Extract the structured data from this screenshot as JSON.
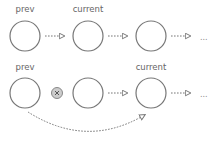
{
  "diagram": {
    "colors": {
      "stroke": "#777777",
      "label": "#666666",
      "removed_fill": "#cccccc",
      "background": "#ffffff"
    },
    "rows": [
      {
        "name": "before",
        "labels": [
          {
            "text": "prev",
            "node": 0
          },
          {
            "text": "current",
            "node": 1
          }
        ],
        "nodes": 3,
        "ellipsis": "..."
      },
      {
        "name": "after",
        "labels": [
          {
            "text": "prev",
            "node": 0
          },
          {
            "text": "current",
            "node": 2
          }
        ],
        "nodes": 3,
        "removed_marker": "x-circle-icon",
        "ellipsis": "...",
        "bypass_arrow": "prev-to-current"
      }
    ],
    "row1": {
      "prev_label": "prev",
      "current_label": "current",
      "ellipsis": "..."
    },
    "row2": {
      "prev_label": "prev",
      "current_label": "current",
      "ellipsis": "..."
    }
  }
}
